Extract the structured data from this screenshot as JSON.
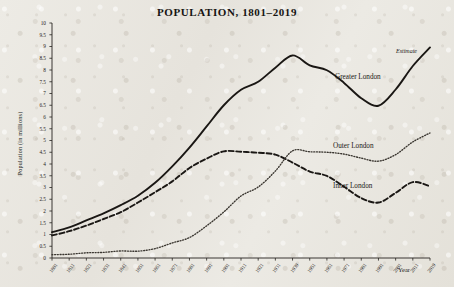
{
  "chart_data": {
    "type": "line",
    "title": "POPULATION, 1801–2019",
    "xlabel": "Year",
    "ylabel": "Population (in millions)",
    "ylim": [
      0,
      10
    ],
    "ytick_step": 0.5,
    "yticks": [
      "0",
      "0.5",
      "1",
      "1.5",
      "2",
      "2.5",
      "3",
      "3.5",
      "4",
      "4.5",
      "5",
      "5.5",
      "6",
      "6.5",
      "7",
      "7.5",
      "8",
      "8.5",
      "9",
      "9.5",
      "10"
    ],
    "grid": false,
    "legend_position": "inline-labels",
    "x": [
      1801,
      1811,
      1821,
      1831,
      1841,
      1851,
      1861,
      1871,
      1881,
      1891,
      1901,
      1911,
      1921,
      1931,
      1939,
      1951,
      1961,
      1971,
      1981,
      1991,
      2001,
      2011,
      2019
    ],
    "xtick_labels": [
      "1801",
      "1811",
      "1821",
      "1831",
      "1841",
      "1851",
      "1861",
      "1871",
      "1881",
      "1891",
      "1901",
      "1911",
      "1921",
      "1931",
      "1939",
      "1951",
      "1961",
      "1971",
      "1981",
      "1991",
      "2001",
      "2011",
      "2019"
    ],
    "series": [
      {
        "name": "Greater London",
        "style": "solid",
        "color": "#1a1714",
        "values": [
          1.1,
          1.3,
          1.6,
          1.9,
          2.25,
          2.65,
          3.2,
          3.9,
          4.7,
          5.6,
          6.5,
          7.16,
          7.5,
          8.1,
          8.62,
          8.2,
          7.99,
          7.45,
          6.8,
          6.48,
          7.17,
          8.17,
          8.96
        ],
        "label_position": {
          "x": 335,
          "y": 73
        }
      },
      {
        "name": "Inner London",
        "style": "dashed",
        "color": "#1a1714",
        "values": [
          0.96,
          1.14,
          1.38,
          1.66,
          1.95,
          2.36,
          2.8,
          3.26,
          3.83,
          4.23,
          4.54,
          4.52,
          4.48,
          4.4,
          4.06,
          3.68,
          3.49,
          3.03,
          2.55,
          2.36,
          2.77,
          3.23,
          3.05
        ],
        "label_position": {
          "x": 333,
          "y": 182
        }
      },
      {
        "name": "Outer London",
        "style": "dotted",
        "color": "#3a3630",
        "values": [
          0.14,
          0.16,
          0.22,
          0.24,
          0.3,
          0.29,
          0.4,
          0.64,
          0.87,
          1.37,
          1.96,
          2.64,
          3.02,
          3.7,
          4.56,
          4.52,
          4.5,
          4.42,
          4.25,
          4.12,
          4.4,
          4.94,
          5.32
        ],
        "label_position": {
          "x": 333,
          "y": 142
        }
      }
    ],
    "annotations": [
      {
        "text": "Estimate",
        "x": 396,
        "y": 48,
        "style": "italic"
      }
    ]
  }
}
